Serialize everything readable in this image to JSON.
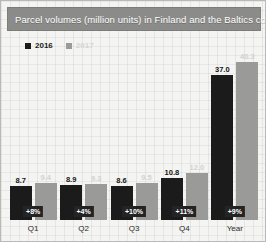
{
  "title": "Parcel volumes (million units) in Finland and the Baltics combined",
  "legend": [
    {
      "label": "2016",
      "color": "#1b1b1b"
    },
    {
      "label": "2017",
      "color": "#9a9a98"
    }
  ],
  "chart_data": {
    "type": "bar",
    "title": "Parcel volumes (million units) in Finland and the Baltics combined",
    "xlabel": "",
    "ylabel": "",
    "ylim": [
      0,
      42
    ],
    "grid": false,
    "legend_position": "top-left",
    "categories": [
      "Q1",
      "Q2",
      "Q3",
      "Q4",
      "Year"
    ],
    "series": [
      {
        "name": "2016",
        "color": "#1b1b1b",
        "values": [
          8.7,
          8.9,
          8.6,
          10.8,
          37.0
        ]
      },
      {
        "name": "2017",
        "color": "#9a9a98",
        "values": [
          9.4,
          9.3,
          9.5,
          12.0,
          40.3
        ]
      }
    ],
    "value_labels_2016": [
      "8.7",
      "8.9",
      "8.6",
      "10.8",
      "37.0"
    ],
    "value_labels_2017": [
      "9.4",
      "9.3",
      "9.5",
      "12.0",
      "40.3"
    ],
    "growth_badges": [
      "+8%",
      "+4%",
      "+10%",
      "+11%",
      "+9%"
    ],
    "annotations": [
      {
        "category": "Q1",
        "text": "+8%"
      },
      {
        "category": "Q2",
        "text": "+4%"
      },
      {
        "category": "Q3",
        "text": "+10%"
      },
      {
        "category": "Q4",
        "text": "+11%"
      },
      {
        "category": "Year",
        "text": "+9%"
      }
    ]
  },
  "colors": {
    "title_bar": "#8b8b89",
    "title_text": "#ffffff",
    "series_2016": "#1b1b1b",
    "series_2017": "#9a9a98",
    "badge_bg": "#242424",
    "badge_text": "#ffffff",
    "background": "#f4f4f2"
  }
}
